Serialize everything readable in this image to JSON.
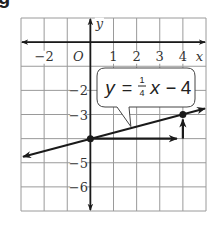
{
  "figure": {
    "corner_label": "g",
    "grid": {
      "x_min": -3,
      "x_max": 5,
      "y_min": -7,
      "y_max": 1,
      "step": 1,
      "grid_color": "#9a9a9a",
      "axis_color": "#1a1a1a"
    },
    "axes": {
      "x_label": "x",
      "y_label": "y",
      "origin_label": "O",
      "x_ticks": [
        {
          "value": -2,
          "label": "−2"
        },
        {
          "value": 1,
          "label": "1"
        },
        {
          "value": 2,
          "label": "2"
        },
        {
          "value": 3,
          "label": "3"
        },
        {
          "value": 4,
          "label": "4"
        }
      ],
      "y_ticks": [
        {
          "value": -2,
          "label": "−2"
        },
        {
          "value": -3,
          "label": "−3"
        },
        {
          "value": -5,
          "label": "−5"
        },
        {
          "value": -6,
          "label": "−6"
        }
      ]
    },
    "line": {
      "slope": 0.25,
      "intercept": -4,
      "x_from": -3,
      "x_to": 5,
      "color": "#1a1a1a"
    },
    "points": [
      {
        "x": 0,
        "y": -4
      },
      {
        "x": 4,
        "y": -3
      }
    ],
    "slope_triangle": {
      "run": {
        "from": [
          0,
          -4
        ],
        "to": [
          4,
          -4
        ]
      },
      "rise": {
        "from": [
          4,
          -4
        ],
        "to": [
          4,
          -3
        ]
      }
    },
    "callout": {
      "lhs": "y",
      "equals": "=",
      "frac_num": "1",
      "frac_den": "4",
      "var": "x",
      "minus": "−",
      "const": "4",
      "pointer_to": [
        1.75,
        -3.5
      ]
    }
  }
}
